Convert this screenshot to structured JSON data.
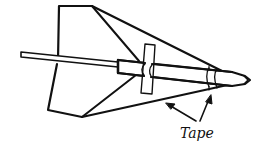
{
  "diagram": {
    "labels": [
      {
        "id": "tape",
        "text": "Tape",
        "x": 180,
        "y": 127
      }
    ],
    "arrows": [
      {
        "from": [
          196,
          121
        ],
        "to": [
          167,
          104
        ]
      },
      {
        "from": [
          200,
          121
        ],
        "to": [
          210,
          96
        ]
      }
    ],
    "colors": {
      "stroke": "#111111",
      "background": "#ffffff"
    }
  }
}
